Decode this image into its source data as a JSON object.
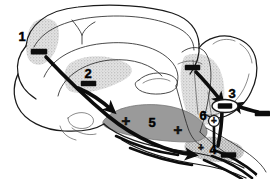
{
  "figure": {
    "kind": "anatomical-diagram",
    "background_color": "#ffffff",
    "line_color": "#1a1a1a",
    "width": 270,
    "height": 179
  },
  "palette": {
    "stipple_light": "#d9d9d9",
    "stipple_mid": "#c9c9c9",
    "region_gray": "#9a9a9a",
    "ink": "#0d0d0d",
    "paper": "#ffffff"
  },
  "labels": [
    {
      "id": "1",
      "text": "1",
      "x": 22,
      "y": 36,
      "sign": "minus"
    },
    {
      "id": "2",
      "text": "2",
      "x": 88,
      "y": 78,
      "sign": "minus"
    },
    {
      "id": "3",
      "text": "3",
      "x": 232,
      "y": 93,
      "sign": "minus"
    },
    {
      "id": "4",
      "text": "4",
      "x": 214,
      "y": 152,
      "sign": "minus"
    },
    {
      "id": "5",
      "text": "5",
      "x": 150,
      "y": 122,
      "sign": "plus"
    },
    {
      "id": "6",
      "text": "6",
      "x": 205,
      "y": 118,
      "sign": "plus"
    }
  ],
  "signs": {
    "minus_marks": [
      {
        "for": "1",
        "x": 38,
        "y": 53
      },
      {
        "for": "2",
        "x": 88,
        "y": 84
      },
      {
        "for": "3",
        "x": 231,
        "y": 107
      },
      {
        "for": "4",
        "x": 228,
        "y": 155
      },
      {
        "for": "upper-right-input",
        "x": 192,
        "y": 68
      },
      {
        "for": "right-edge-input",
        "x": 261,
        "y": 114
      }
    ],
    "plus_marks": [
      {
        "for": "5a",
        "text": "+",
        "x": 126,
        "y": 122
      },
      {
        "for": "5b",
        "text": "+",
        "x": 178,
        "y": 131
      },
      {
        "for": "4-region",
        "text": "+",
        "x": 201,
        "y": 148
      },
      {
        "for": "6-circle",
        "text": "+",
        "x": 214,
        "y": 121
      }
    ]
  },
  "regions": [
    {
      "name": "frontal-cortex-region",
      "fill": "#d9d9d9",
      "related_label": "1"
    },
    {
      "name": "mid-cortex-region",
      "fill": "#d0d0d0",
      "related_label": "2"
    },
    {
      "name": "brainstem-region",
      "fill": "#d4d4d4",
      "related_label": "3"
    },
    {
      "name": "central-gray-region",
      "fill": "#9a9a9a",
      "related_label": "5"
    },
    {
      "name": "ventral-region",
      "fill": "#c9c9c9",
      "related_label": "4"
    }
  ],
  "pathways": [
    {
      "name": "pathway-1-descending",
      "from": "1",
      "to": "central-gray-region",
      "arrow": true
    },
    {
      "name": "pathway-2-descending",
      "from": "2",
      "to": "central-gray-region",
      "arrow": true
    },
    {
      "name": "pathway-upper-right",
      "from": "upper-right-input",
      "to": "3",
      "arrow": true
    },
    {
      "name": "pathway-right-edge",
      "from": "right-edge-input",
      "to": "3",
      "arrow": true
    },
    {
      "name": "pathway-3-descending",
      "from": "3",
      "to": "4",
      "arrow": false
    },
    {
      "name": "pathway-6-descending",
      "from": "6",
      "to": "4",
      "arrow": false
    },
    {
      "name": "pathway-ventral-out",
      "from": "central-gray-region",
      "to": "4",
      "arrow": true
    }
  ]
}
